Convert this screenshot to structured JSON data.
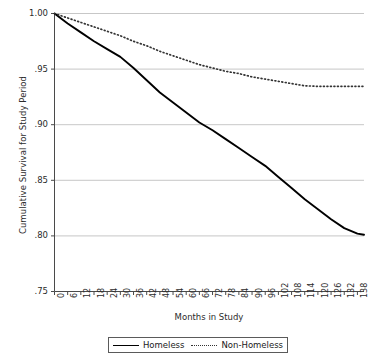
{
  "chart_data": {
    "type": "line",
    "title": "",
    "xlabel": "Months in Study",
    "ylabel": "Cumulative Survival for Study Period",
    "xlim": [
      0,
      141
    ],
    "ylim": [
      0.75,
      1.0
    ],
    "grid": "horizontal",
    "legend_position": "bottom",
    "xticks": [
      0,
      6,
      12,
      18,
      24,
      30,
      36,
      42,
      48,
      54,
      60,
      66,
      72,
      78,
      84,
      90,
      96,
      102,
      108,
      114,
      120,
      126,
      132,
      138
    ],
    "xtick_labels": [
      "0",
      "6",
      "12",
      "18",
      "24",
      "30",
      "36",
      "42",
      "48",
      "54",
      "60",
      "66",
      "72",
      "78",
      "84",
      "90",
      "96",
      "102",
      "108",
      "114",
      "120",
      "126",
      "132",
      "138"
    ],
    "yticks": [
      0.75,
      0.8,
      0.85,
      0.9,
      0.95,
      1.0
    ],
    "ytick_labels": [
      ".75",
      ".80",
      ".85",
      ".90",
      ".95",
      "1.00"
    ],
    "x": [
      0,
      6,
      12,
      18,
      24,
      30,
      36,
      42,
      48,
      54,
      60,
      66,
      72,
      78,
      84,
      90,
      96,
      102,
      108,
      114,
      120,
      126,
      132,
      138,
      141
    ],
    "series": [
      {
        "name": "Homeless",
        "style": "solid",
        "color": "#000000",
        "values": [
          1.0,
          0.991,
          0.983,
          0.975,
          0.968,
          0.961,
          0.951,
          0.94,
          0.929,
          0.92,
          0.911,
          0.902,
          0.895,
          0.887,
          0.879,
          0.871,
          0.863,
          0.853,
          0.843,
          0.833,
          0.824,
          0.815,
          0.807,
          0.802,
          0.801
        ]
      },
      {
        "name": "Non-Homeless",
        "style": "dotted",
        "color": "#333333",
        "values": [
          1.0,
          0.996,
          0.992,
          0.988,
          0.984,
          0.98,
          0.975,
          0.971,
          0.966,
          0.962,
          0.958,
          0.954,
          0.951,
          0.948,
          0.946,
          0.943,
          0.941,
          0.939,
          0.937,
          0.935,
          0.9345,
          0.9345,
          0.9345,
          0.9345,
          0.9345
        ]
      }
    ]
  },
  "legend": {
    "items": [
      {
        "label": "Homeless",
        "style": "solid"
      },
      {
        "label": "Non-Homeless",
        "style": "dotted"
      }
    ]
  }
}
